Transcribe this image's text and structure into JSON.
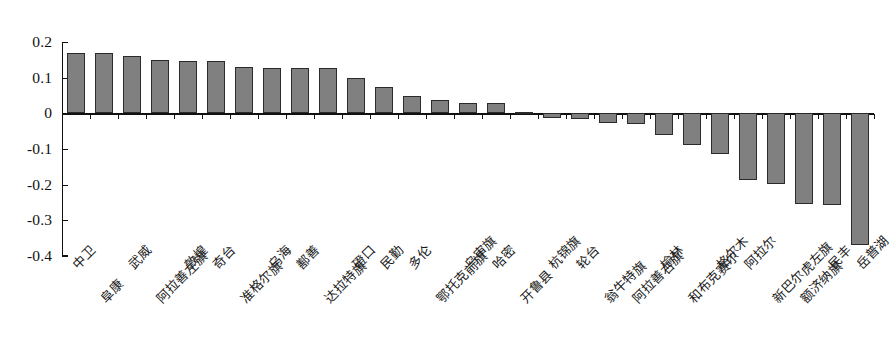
{
  "chart_data": {
    "type": "bar",
    "title": "",
    "subtitle": "",
    "xlabel": "",
    "ylabel": "",
    "ylim": [
      -0.4,
      0.2
    ],
    "yticks": [
      0.2,
      0.1,
      0,
      -0.1,
      -0.2,
      -0.3,
      -0.4
    ],
    "ytick_labels": [
      "0.2",
      "0.1",
      "0",
      "-0.1",
      "-0.2",
      "-0.3",
      "-0.4"
    ],
    "grid": false,
    "legend": null,
    "bar_color": "#808080",
    "bar_edge_color": "#2b2b2b",
    "axis_color": "#111111",
    "categories": [
      "中卫",
      "阜康",
      "武威",
      "阿拉善左旗",
      "敦煌",
      "奇台",
      "准格尔旗",
      "乌海",
      "鄯善",
      "达拉特旗",
      "磴口",
      "民勤",
      "多伦",
      "鄂托克前旗",
      "乌审旗",
      "哈密",
      "开鲁县",
      "杭锦旗",
      "轮台",
      "翁牛特旗",
      "阿拉善右旗",
      "榆林",
      "和布克赛尔",
      "格尔木",
      "阿拉尔",
      "新巴尔虎左旗",
      "额济纳旗",
      "民丰",
      "岳普湖"
    ],
    "values": [
      0.17,
      0.168,
      0.16,
      0.15,
      0.147,
      0.147,
      0.131,
      0.128,
      0.128,
      0.127,
      0.098,
      0.073,
      0.05,
      0.036,
      0.029,
      0.028,
      0.004,
      -0.012,
      -0.015,
      -0.028,
      -0.03,
      -0.062,
      -0.09,
      -0.115,
      -0.188,
      -0.198,
      -0.255,
      -0.258,
      -0.37
    ],
    "label_rows": [
      0,
      1,
      0,
      1,
      0,
      0,
      1,
      0,
      0,
      1,
      0,
      0,
      0,
      1,
      0,
      0,
      1,
      0,
      0,
      1,
      1,
      0,
      1,
      0,
      0,
      1,
      1,
      0,
      0
    ]
  }
}
